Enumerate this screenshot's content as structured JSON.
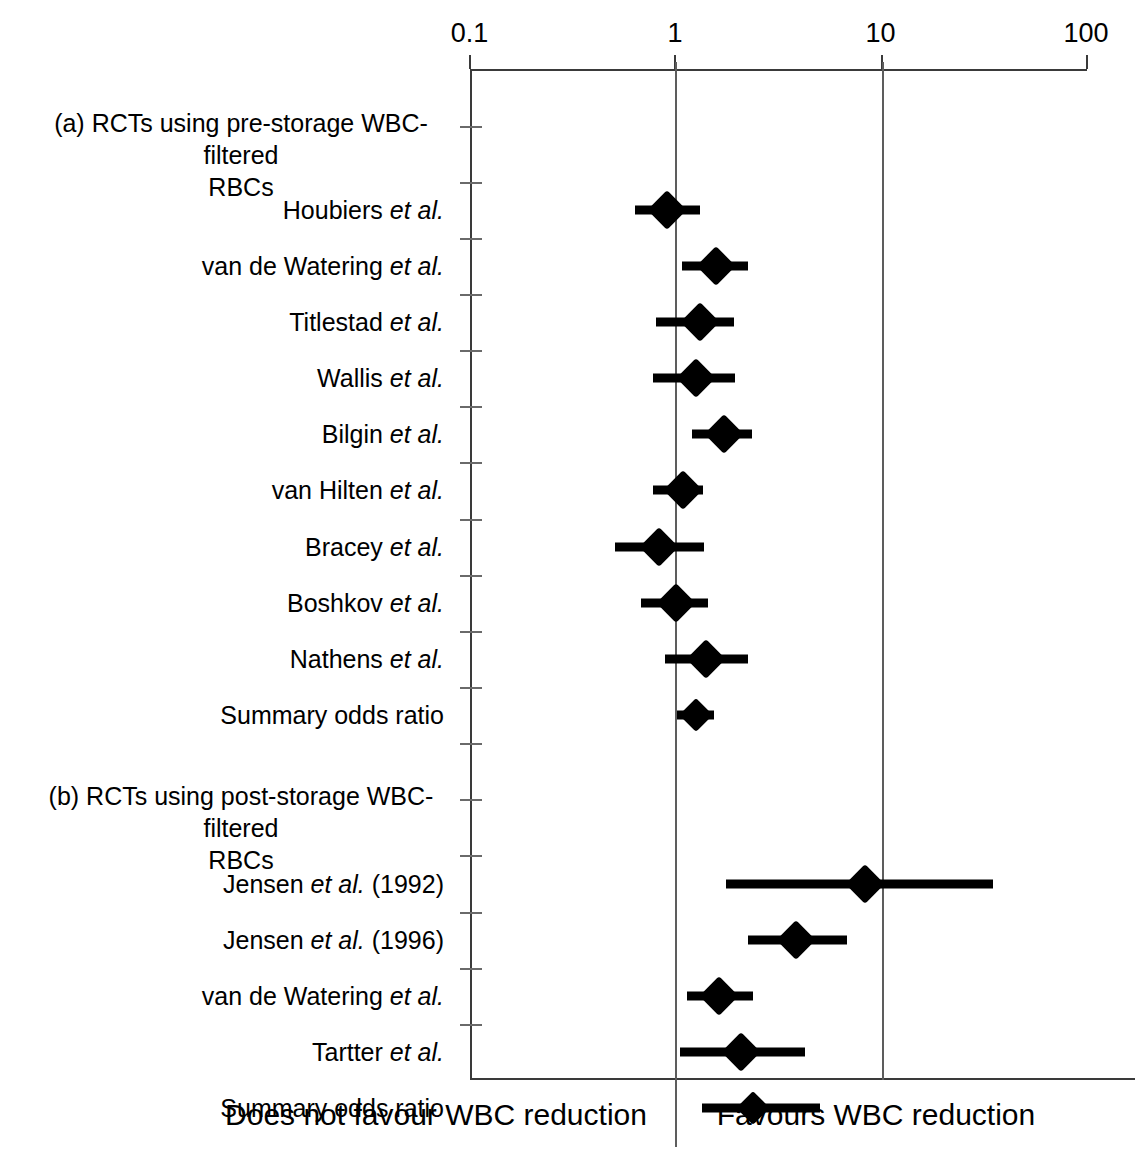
{
  "chart_data": {
    "type": "forest-plot",
    "title": "",
    "xlabel": "Odds ratio (log scale)",
    "ylabel": "",
    "xscale": "log",
    "xlim": [
      0.1,
      100
    ],
    "xticks": [
      0.1,
      1,
      10,
      100
    ],
    "xtick_labels": [
      "0.1",
      "1",
      "10",
      "100"
    ],
    "reference_lines": [
      1,
      10
    ],
    "grid": false,
    "legend": "none",
    "footer_left": "Does not favour WBC reduction",
    "footer_right": "Favours WBC reduction",
    "sections": [
      {
        "id": "a",
        "heading_line1": "(a) RCTs using pre-storage WBC-filtered",
        "heading_line2": "RBCs",
        "rows": [
          {
            "label_main": "Houbiers ",
            "label_em": "et al.",
            "label_tail": "",
            "or": 0.91,
            "ci_low": 0.64,
            "ci_high": 1.32,
            "summary": false
          },
          {
            "label_main": "van de Watering ",
            "label_em": "et al.",
            "label_tail": "",
            "or": 1.59,
            "ci_low": 1.08,
            "ci_high": 2.26,
            "summary": false
          },
          {
            "label_main": "Titlestad ",
            "label_em": "et al.",
            "label_tail": "",
            "or": 1.32,
            "ci_low": 0.81,
            "ci_high": 1.93,
            "summary": false
          },
          {
            "label_main": "Wallis ",
            "label_em": "et al.",
            "label_tail": "",
            "or": 1.26,
            "ci_low": 0.78,
            "ci_high": 1.95,
            "summary": false
          },
          {
            "label_main": "Bilgin ",
            "label_em": "et al.",
            "label_tail": "",
            "or": 1.74,
            "ci_low": 1.21,
            "ci_high": 2.37,
            "summary": false
          },
          {
            "label_main": "van Hilten ",
            "label_em": "et al.",
            "label_tail": "",
            "or": 1.09,
            "ci_low": 0.78,
            "ci_high": 1.37,
            "summary": false
          },
          {
            "label_main": "Bracey ",
            "label_em": "et al.",
            "label_tail": "",
            "or": 0.84,
            "ci_low": 0.51,
            "ci_high": 1.39,
            "summary": false
          },
          {
            "label_main": "Boshkov ",
            "label_em": "et al.",
            "label_tail": "",
            "or": 1.01,
            "ci_low": 0.68,
            "ci_high": 1.44,
            "summary": false
          },
          {
            "label_main": "Nathens ",
            "label_em": "et al.",
            "label_tail": "",
            "or": 1.42,
            "ci_low": 0.89,
            "ci_high": 2.26,
            "summary": false
          },
          {
            "label_main": "Summary odds ratio",
            "label_em": "",
            "label_tail": "",
            "or": 1.26,
            "ci_low": 1.02,
            "ci_high": 1.55,
            "summary": true
          }
        ]
      },
      {
        "id": "b",
        "heading_line1": "(b) RCTs using post-storage WBC-filtered",
        "heading_line2": "RBCs",
        "rows": [
          {
            "label_main": "Jensen ",
            "label_em": "et al.",
            "label_tail": " (1992)",
            "or": 8.4,
            "ci_low": 1.78,
            "ci_high": 35.4,
            "summary": false
          },
          {
            "label_main": "Jensen ",
            "label_em": "et al.",
            "label_tail": " (1996)",
            "or": 3.9,
            "ci_low": 2.26,
            "ci_high": 6.9,
            "summary": false
          },
          {
            "label_main": "van de Watering ",
            "label_em": "et al.",
            "label_tail": "",
            "or": 1.63,
            "ci_low": 1.15,
            "ci_high": 2.4,
            "summary": false
          },
          {
            "label_main": "Tartter ",
            "label_em": "et al.",
            "label_tail": "",
            "or": 2.1,
            "ci_low": 1.06,
            "ci_high": 4.3,
            "summary": false
          },
          {
            "label_main": "Summary odds ratio",
            "label_em": "",
            "label_tail": "",
            "or": 2.4,
            "ci_low": 1.35,
            "ci_high": 5.1,
            "summary": true
          }
        ]
      }
    ]
  },
  "axis": {
    "tick_labels": [
      "0.1",
      "1",
      "10",
      "100"
    ]
  },
  "footer": {
    "left": "Does not favour WBC reduction",
    "right": "Favours WBC reduction"
  },
  "colors": {
    "marker": "#000000",
    "axis": "#3a3a3a",
    "reference": "#5d5d5d",
    "background": "#ffffff"
  }
}
